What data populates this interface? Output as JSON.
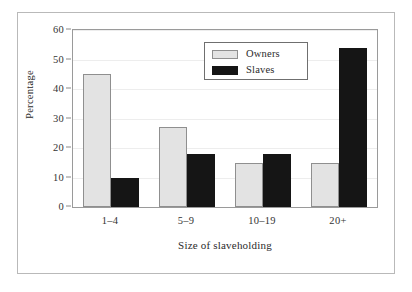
{
  "chart_data": {
    "type": "bar",
    "title": "",
    "xlabel": "Size of slaveholding",
    "ylabel": "Percentage",
    "categories": [
      "1–4",
      "5–9",
      "10–19",
      "20+"
    ],
    "series": [
      {
        "name": "Owners",
        "color": "#e3e3e3",
        "values": [
          45,
          27,
          15,
          15
        ]
      },
      {
        "name": "Slaves",
        "color": "#151515",
        "values": [
          10,
          18,
          18,
          54
        ]
      }
    ],
    "ylim": [
      0,
      60
    ],
    "yticks": [
      0,
      10,
      20,
      30,
      40,
      50,
      60
    ],
    "ytick_labels": [
      "0",
      "10",
      "20",
      "30",
      "40",
      "50",
      "60"
    ],
    "grid": true,
    "legend_position": "top-center"
  },
  "legend": {
    "entries": [
      {
        "label": "Owners",
        "swatch": "light-gray-swatch"
      },
      {
        "label": "Slaves",
        "swatch": "black-swatch"
      }
    ]
  }
}
